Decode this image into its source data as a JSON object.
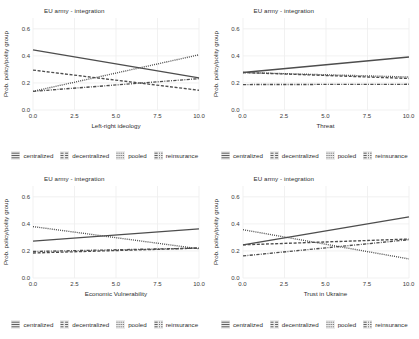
{
  "figure": {
    "panel_count": 4,
    "shared_title": "EU army - integration",
    "shared_ylabel": "Prob. policy/polity group",
    "legend_labels": [
      "centralized",
      "decentralized",
      "pooled",
      "reinsurance"
    ],
    "yticks": [
      "0.0",
      "0.2",
      "0.4",
      "0.6"
    ],
    "xticks": [
      "0.0",
      "2.5",
      "5.0",
      "7.5",
      "10.0"
    ]
  },
  "chart_data": [
    {
      "type": "line",
      "title": "EU army - integration",
      "xlabel": "Left-right ideology",
      "ylabel": "Prob. policy/polity group",
      "xlim": [
        0,
        10
      ],
      "ylim": [
        0.0,
        0.68
      ],
      "xticks": [
        0.0,
        2.5,
        5.0,
        7.5,
        10.0
      ],
      "yticks": [
        0.0,
        0.2,
        0.4,
        0.6
      ],
      "grid": true,
      "legend_position": "bottom",
      "series": [
        {
          "name": "centralized",
          "style": "solid",
          "x": [
            0,
            10
          ],
          "values": [
            0.445,
            0.238
          ]
        },
        {
          "name": "decentralized",
          "style": "dashed",
          "x": [
            0,
            10
          ],
          "values": [
            0.295,
            0.146
          ]
        },
        {
          "name": "pooled",
          "style": "dotted",
          "x": [
            0,
            10
          ],
          "values": [
            0.138,
            0.408
          ]
        },
        {
          "name": "reinsurance",
          "style": "dotdashed",
          "x": [
            0,
            10
          ],
          "values": [
            0.138,
            0.232
          ]
        }
      ]
    },
    {
      "type": "line",
      "title": "EU army - integration",
      "xlabel": "Threat",
      "ylabel": "Prob. policy/polity group",
      "xlim": [
        0,
        10
      ],
      "ylim": [
        0.0,
        0.68
      ],
      "xticks": [
        0.0,
        2.5,
        5.0,
        7.5,
        10.0
      ],
      "yticks": [
        0.0,
        0.2,
        0.4,
        0.6
      ],
      "grid": true,
      "legend_position": "bottom",
      "series": [
        {
          "name": "centralized",
          "style": "solid",
          "x": [
            0,
            10
          ],
          "values": [
            0.277,
            0.392
          ]
        },
        {
          "name": "decentralized",
          "style": "dashed",
          "x": [
            0,
            10
          ],
          "values": [
            0.277,
            0.233
          ]
        },
        {
          "name": "pooled",
          "style": "dotted",
          "x": [
            0,
            10
          ],
          "values": [
            0.277,
            0.244
          ]
        },
        {
          "name": "reinsurance",
          "style": "dotdashed",
          "x": [
            0,
            10
          ],
          "values": [
            0.188,
            0.19
          ]
        }
      ]
    },
    {
      "type": "line",
      "title": "EU army - integration",
      "xlabel": "Economic Vulnerability",
      "ylabel": "Prob. policy/polity group",
      "xlim": [
        0,
        10
      ],
      "ylim": [
        0.0,
        0.68
      ],
      "xticks": [
        0.0,
        2.5,
        5.0,
        7.5,
        10.0
      ],
      "yticks": [
        0.0,
        0.2,
        0.4,
        0.6
      ],
      "grid": true,
      "legend_position": "bottom",
      "series": [
        {
          "name": "centralized",
          "style": "solid",
          "x": [
            0,
            10
          ],
          "values": [
            0.272,
            0.363
          ]
        },
        {
          "name": "decentralized",
          "style": "dashed",
          "x": [
            0,
            10
          ],
          "values": [
            0.185,
            0.221
          ]
        },
        {
          "name": "pooled",
          "style": "dotted",
          "x": [
            0,
            10
          ],
          "values": [
            0.38,
            0.216
          ]
        },
        {
          "name": "reinsurance",
          "style": "dotdashed",
          "x": [
            0,
            10
          ],
          "values": [
            0.196,
            0.221
          ]
        }
      ]
    },
    {
      "type": "line",
      "title": "EU army - integration",
      "xlabel": "Trust in Ukraine",
      "ylabel": "Prob. policy/polity group",
      "xlim": [
        0,
        10
      ],
      "ylim": [
        0.0,
        0.68
      ],
      "xticks": [
        0.0,
        2.5,
        5.0,
        7.5,
        10.0
      ],
      "yticks": [
        0.0,
        0.2,
        0.4,
        0.6
      ],
      "grid": true,
      "legend_position": "bottom",
      "series": [
        {
          "name": "centralized",
          "style": "solid",
          "x": [
            0,
            10
          ],
          "values": [
            0.245,
            0.452
          ]
        },
        {
          "name": "decentralized",
          "style": "dashed",
          "x": [
            0,
            10
          ],
          "values": [
            0.245,
            0.288
          ]
        },
        {
          "name": "pooled",
          "style": "dotted",
          "x": [
            0,
            10
          ],
          "values": [
            0.357,
            0.141
          ]
        },
        {
          "name": "reinsurance",
          "style": "dotdashed",
          "x": [
            0,
            10
          ],
          "values": [
            0.163,
            0.283
          ]
        }
      ]
    }
  ],
  "colors": {
    "line": "#4d4d4d",
    "grid": "#ededed",
    "panel_background": "#ffffff",
    "legend_key": "#ebebeb",
    "text": "#2e2e2e"
  }
}
